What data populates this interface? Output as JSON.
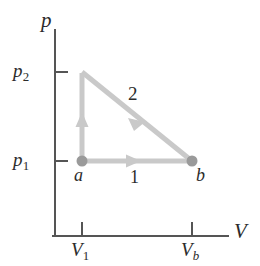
{
  "figure": {
    "background": "#ffffff",
    "width": 260,
    "height": 266
  },
  "axes": {
    "color": "#555555",
    "y_axis_label": "p",
    "x_axis_label": "V",
    "y_ticks": [
      {
        "label_main": "p",
        "label_sub": "2",
        "value_y": 72
      },
      {
        "label_main": "p",
        "label_sub": "1",
        "value_y": 161
      }
    ],
    "x_ticks": [
      {
        "label_main": "V",
        "label_sub": "1",
        "value_x": 82
      },
      {
        "label_main": "V",
        "label_sub": "b",
        "value_x": 192
      }
    ]
  },
  "points": [
    {
      "name": "a",
      "label": "a",
      "x": 82,
      "y": 161,
      "color": "#9a9a9a"
    },
    {
      "name": "b",
      "label": "b",
      "x": 192,
      "y": 161,
      "color": "#9a9a9a"
    }
  ],
  "paths": [
    {
      "name": "path-1",
      "label": "1",
      "description": "isobaric expansion from a to b at pressure p1",
      "from": "a",
      "to": "b",
      "color": "#c9c9c9",
      "arrow_at": {
        "x": 133,
        "y": 161
      }
    },
    {
      "name": "path-2",
      "label": "2",
      "description": "isochoric rise from a to p2 then diagonal down to b",
      "from": "a",
      "to": "b",
      "color": "#c9c9c9",
      "vertex": {
        "x": 82,
        "y": 72
      },
      "arrow_vertical_at": {
        "x": 82,
        "y": 120
      },
      "arrow_diagonal_at": {
        "x": 136,
        "y": 117
      }
    }
  ],
  "colors": {
    "axis": "#555555",
    "curve": "#c9c9c9",
    "point": "#9a9a9a",
    "text": "#2b2b2b"
  }
}
